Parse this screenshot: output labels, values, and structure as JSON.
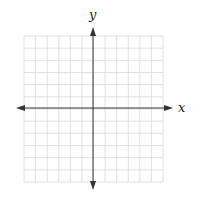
{
  "diagram": {
    "type": "coordinate-plane",
    "x_axis_label": "x",
    "y_axis_label": "y",
    "grid": {
      "left": 24,
      "right": 163,
      "top": 36,
      "bottom": 182,
      "columns": 12,
      "rows": 12
    },
    "origin_px": {
      "x": 93,
      "y": 108
    },
    "colors": {
      "grid": "#d8d8d8",
      "axis": "#333333",
      "label": "#222222"
    }
  }
}
